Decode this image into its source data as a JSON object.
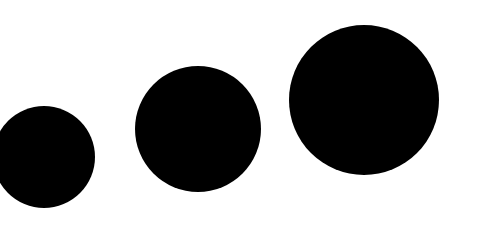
{
  "canvas": {
    "width": 481,
    "height": 226,
    "background": "#ffffff"
  },
  "shapes": [
    {
      "type": "circle",
      "cx": 44,
      "cy": 157,
      "r": 51,
      "fill": "#000000"
    },
    {
      "type": "circle",
      "cx": 198,
      "cy": 129,
      "r": 63,
      "fill": "#000000"
    },
    {
      "type": "circle",
      "cx": 364,
      "cy": 100,
      "r": 75,
      "fill": "#000000"
    }
  ]
}
